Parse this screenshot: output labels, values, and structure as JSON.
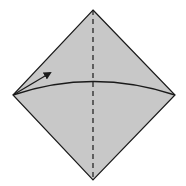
{
  "diagram": {
    "type": "origami-fold-step",
    "colors": {
      "paper_fill": "#c8c8c8",
      "outline": "#1a1a1a",
      "background": "#ffffff"
    },
    "shapes": {
      "diamond_points": "93,10 175,95 93,180 13,95",
      "fold_line": {
        "x1": 93,
        "y1": 10,
        "x2": 93,
        "y2": 180,
        "dash": "5,4"
      },
      "curve_path": "M13,95 Q93,68 175,95",
      "arrow_path": "M13,95 L50,73"
    }
  }
}
